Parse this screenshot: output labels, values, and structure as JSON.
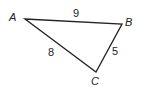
{
  "diagram": {
    "type": "triangle",
    "vertices": [
      {
        "id": "A",
        "label": "A",
        "x": 25,
        "y": 19,
        "label_x": 9,
        "label_y": 21
      },
      {
        "id": "B",
        "label": "B",
        "x": 122,
        "y": 24,
        "label_x": 125,
        "label_y": 26
      },
      {
        "id": "C",
        "label": "C",
        "x": 96,
        "y": 72,
        "label_x": 91,
        "label_y": 85
      }
    ],
    "sides": [
      {
        "from": "A",
        "to": "B",
        "length_label": "9",
        "label_x": 73,
        "label_y": 17
      },
      {
        "from": "A",
        "to": "C",
        "length_label": "8",
        "label_x": 48,
        "label_y": 56
      },
      {
        "from": "B",
        "to": "C",
        "length_label": "5",
        "label_x": 112,
        "label_y": 55
      }
    ],
    "stroke_color": "#222222",
    "background": "#ffffff"
  }
}
